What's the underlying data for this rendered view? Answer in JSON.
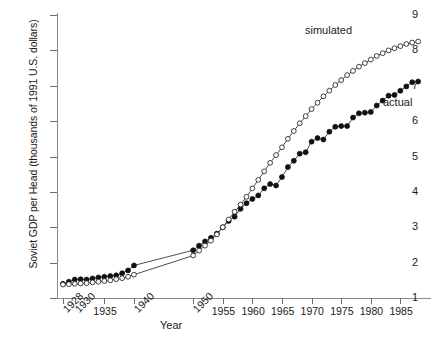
{
  "chart_data": {
    "type": "line",
    "title": "",
    "xlabel": "Year",
    "ylabel": "Soviet GDP per Head (thousands of 1991 U.S. dollars)",
    "xlim": [
      1927,
      1990
    ],
    "ylim": [
      1,
      9
    ],
    "grid": false,
    "legend_position": "inline-annotation",
    "ytick_labels": [
      "1",
      "2",
      "3",
      "4",
      "5",
      "6",
      "7",
      "8",
      "9"
    ],
    "ytick_values": [
      1,
      2,
      3,
      4,
      5,
      6,
      7,
      8,
      9
    ],
    "xtick_labels": [
      "1928",
      "1930",
      "1935",
      "1940",
      "1950",
      "1955",
      "1960",
      "1965",
      "1970",
      "1975",
      "1980",
      "1985"
    ],
    "xtick_values": [
      1928,
      1930,
      1935,
      1940,
      1950,
      1955,
      1960,
      1965,
      1970,
      1975,
      1980,
      1985
    ],
    "xtick_rotated": [
      true,
      true,
      false,
      true,
      true,
      false,
      false,
      false,
      false,
      false,
      false,
      false
    ],
    "annotations": [
      {
        "text": "simulated",
        "x": 1972,
        "y": 8.0
      },
      {
        "text": "actual",
        "x": 1983,
        "y": 6.3
      }
    ],
    "series": [
      {
        "name": "actual",
        "marker": "filled-circle",
        "x": [
          1928,
          1929,
          1930,
          1931,
          1932,
          1933,
          1934,
          1935,
          1936,
          1937,
          1938,
          1939,
          1940,
          1950,
          1951,
          1952,
          1953,
          1954,
          1955,
          1956,
          1957,
          1958,
          1959,
          1960,
          1961,
          1962,
          1963,
          1964,
          1965,
          1966,
          1967,
          1968,
          1969,
          1970,
          1971,
          1972,
          1973,
          1974,
          1975,
          1976,
          1977,
          1978,
          1979,
          1980,
          1981,
          1982,
          1983,
          1984,
          1985,
          1986,
          1987,
          1988
        ],
        "y": [
          1.4,
          1.46,
          1.52,
          1.53,
          1.52,
          1.55,
          1.58,
          1.6,
          1.62,
          1.64,
          1.7,
          1.78,
          1.92,
          2.35,
          2.48,
          2.6,
          2.7,
          2.82,
          3.0,
          3.18,
          3.3,
          3.52,
          3.68,
          3.8,
          3.9,
          4.1,
          4.22,
          4.18,
          4.42,
          4.7,
          4.88,
          5.08,
          5.12,
          5.42,
          5.52,
          5.48,
          5.7,
          5.84,
          5.86,
          5.86,
          6.1,
          6.22,
          6.24,
          6.26,
          6.44,
          6.58,
          6.72,
          6.74,
          6.86,
          6.98,
          7.1,
          7.12
        ],
        "color": "#111111"
      },
      {
        "name": "simulated",
        "marker": "open-circle",
        "x": [
          1928,
          1929,
          1930,
          1931,
          1932,
          1933,
          1934,
          1935,
          1936,
          1937,
          1938,
          1939,
          1940,
          1950,
          1951,
          1952,
          1953,
          1954,
          1955,
          1956,
          1957,
          1958,
          1959,
          1960,
          1961,
          1962,
          1963,
          1964,
          1965,
          1966,
          1967,
          1968,
          1969,
          1970,
          1971,
          1972,
          1973,
          1974,
          1975,
          1976,
          1977,
          1978,
          1979,
          1980,
          1981,
          1982,
          1983,
          1984,
          1985,
          1986,
          1987,
          1988
        ],
        "y": [
          1.38,
          1.39,
          1.4,
          1.41,
          1.42,
          1.44,
          1.46,
          1.48,
          1.5,
          1.53,
          1.56,
          1.6,
          1.66,
          2.2,
          2.34,
          2.48,
          2.62,
          2.8,
          3.0,
          3.22,
          3.44,
          3.64,
          3.86,
          4.1,
          4.34,
          4.58,
          4.82,
          5.04,
          5.26,
          5.5,
          5.72,
          5.94,
          6.14,
          6.34,
          6.52,
          6.7,
          6.86,
          7.02,
          7.16,
          7.3,
          7.42,
          7.54,
          7.64,
          7.74,
          7.84,
          7.92,
          8.0,
          8.06,
          8.12,
          8.18,
          8.22,
          8.25
        ],
        "color": "#2b2b2b"
      }
    ]
  }
}
